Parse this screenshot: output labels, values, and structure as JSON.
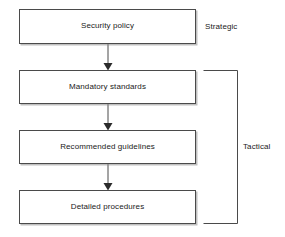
{
  "diagram": {
    "type": "flowchart",
    "orientation": "top-to-bottom",
    "nodes": [
      {
        "id": "security-policy",
        "label": "Security policy",
        "tier": "Strategic"
      },
      {
        "id": "mandatory-standards",
        "label": "Mandatory standards",
        "tier": "Tactical"
      },
      {
        "id": "recommended-guidelines",
        "label": "Recommended guidelines",
        "tier": "Tactical"
      },
      {
        "id": "detailed-procedures",
        "label": "Detailed procedures",
        "tier": "Tactical"
      }
    ],
    "edges": [
      {
        "from": "security-policy",
        "to": "mandatory-standards",
        "arrow": "down"
      },
      {
        "from": "mandatory-standards",
        "to": "recommended-guidelines",
        "arrow": "down"
      },
      {
        "from": "recommended-guidelines",
        "to": "detailed-procedures",
        "arrow": "down"
      }
    ],
    "annotations": [
      {
        "id": "strategic",
        "label": "Strategic",
        "covers": [
          "security-policy"
        ],
        "bracket": false
      },
      {
        "id": "tactical",
        "label": "Tactical",
        "covers": [
          "mandatory-standards",
          "recommended-guidelines",
          "detailed-procedures"
        ],
        "bracket": true
      }
    ],
    "colors": {
      "background": "#ffffff",
      "box_fill": "#ffffff",
      "box_border": "#4a4a4a",
      "box_shadow": "#8c8c8c",
      "text": "#1a1a1a",
      "arrow": "#2b2b2b"
    }
  }
}
